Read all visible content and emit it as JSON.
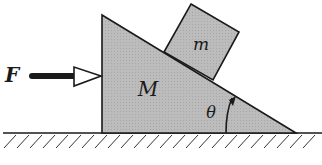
{
  "diagram": {
    "type": "physics-free-body-setup",
    "labels": {
      "force": "F",
      "wedge_mass": "M",
      "block_mass": "m",
      "angle": "θ"
    },
    "colors": {
      "fill": "#b9b9b9",
      "stroke": "#1a1a1a",
      "background": "#ffffff"
    },
    "elements": [
      {
        "id": "wedge",
        "label": "M",
        "shape": "right-triangle"
      },
      {
        "id": "block",
        "label": "m",
        "shape": "square",
        "resting_on": "wedge incline"
      },
      {
        "id": "force-arrow",
        "label": "F",
        "direction": "right"
      },
      {
        "id": "angle-arc",
        "label": "θ"
      },
      {
        "id": "ground",
        "shape": "hatched-surface"
      }
    ]
  }
}
